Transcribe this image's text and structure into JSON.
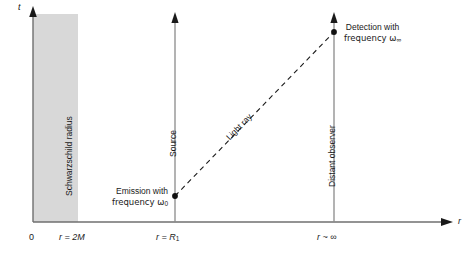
{
  "figure": {
    "type": "spacetime-diagram"
  },
  "axes": {
    "y_axis_label": "t",
    "x_axis_label": "r",
    "origin_label": "0"
  },
  "ticks": [
    {
      "name": "origin",
      "label": "0",
      "x": 33
    },
    {
      "name": "schwarzschild-radius",
      "label": "r = 2M",
      "x": 78
    },
    {
      "name": "source-radius",
      "label": "r = R",
      "sub": "1",
      "x": 175
    },
    {
      "name": "distant-observer-radius",
      "label": "r ~ ∞",
      "x": 334
    }
  ],
  "regions": {
    "schwarzschild": {
      "label": "Schwarzschild radius",
      "fill": "#d8d8d8",
      "x_start": 33,
      "x_end": 78
    }
  },
  "worldlines": [
    {
      "name": "source",
      "label": "Source",
      "x": 175
    },
    {
      "name": "distant-observer",
      "label": "Distant observer",
      "x": 334
    }
  ],
  "light_ray": {
    "label": "Light ray",
    "style": "dashed",
    "from": {
      "x": 175,
      "y": 196
    },
    "to": {
      "x": 334,
      "y": 32
    }
  },
  "events": [
    {
      "name": "emission",
      "line1": "Emission with",
      "line2_pre": "frequency ω",
      "line2_sub": "0",
      "x": 175,
      "y": 196
    },
    {
      "name": "detection",
      "line1": "Detection with",
      "line2_pre": "frequency ω",
      "line2_sub": "∞",
      "x": 334,
      "y": 32
    }
  ],
  "colors": {
    "line": "#6f6f6f",
    "ink": "#1a1a1a",
    "shade": "#d8d8d8"
  }
}
